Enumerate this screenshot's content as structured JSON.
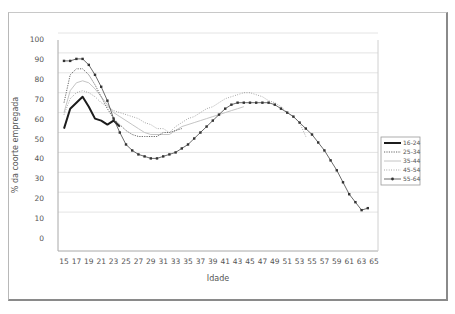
{
  "chart_data": {
    "type": "line",
    "title": "",
    "xlabel": "Idade",
    "ylabel": "% da coorte empregada",
    "ylim": [
      0,
      100
    ],
    "xlim": [
      15,
      65
    ],
    "grid": true,
    "legend_position": "right",
    "y_ticks": [
      "100",
      "90",
      "80",
      "70",
      "60",
      "50",
      "40",
      "30",
      "20",
      "10",
      "0"
    ],
    "x_ticks": [
      "15",
      "17",
      "19",
      "21",
      "23",
      "25",
      "27",
      "29",
      "31",
      "33",
      "35",
      "37",
      "39",
      "41",
      "43",
      "45",
      "47",
      "49",
      "51",
      "53",
      "55",
      "57",
      "59",
      "61",
      "63",
      "65"
    ],
    "series": [
      {
        "name": "16-24",
        "style": "thick-solid",
        "x": [
          15,
          16,
          17,
          18,
          19,
          20,
          21,
          22,
          23,
          24
        ],
        "values": [
          55,
          65,
          68,
          71,
          66,
          60,
          59,
          57,
          59,
          56
        ]
      },
      {
        "name": "25-34",
        "style": "dotted",
        "x": [
          15,
          16,
          17,
          18,
          19,
          20,
          21,
          22,
          23,
          24,
          25,
          26,
          27,
          28,
          29,
          30,
          31,
          32,
          33,
          34
        ],
        "values": [
          68,
          82,
          85,
          85,
          82,
          77,
          71,
          65,
          60,
          57,
          54,
          52,
          51,
          51,
          51,
          51,
          53,
          53,
          54,
          55
        ]
      },
      {
        "name": "35-44",
        "style": "thin-solid-light",
        "x": [
          15,
          16,
          17,
          18,
          19,
          20,
          21,
          22,
          23,
          24,
          25,
          26,
          27,
          28,
          29,
          30,
          31,
          32,
          33,
          34,
          35,
          36,
          37,
          38,
          39,
          40,
          41,
          42,
          43,
          44
        ],
        "values": [
          63,
          74,
          78,
          79,
          78,
          75,
          71,
          67,
          63,
          61,
          59,
          57,
          55,
          53,
          52,
          52,
          52,
          52,
          54,
          56,
          57,
          58,
          59,
          60,
          61,
          62,
          63,
          64,
          65,
          66
        ]
      },
      {
        "name": "45-54",
        "style": "fine-dotted",
        "x": [
          15,
          16,
          17,
          18,
          19,
          20,
          21,
          22,
          23,
          24,
          25,
          26,
          27,
          28,
          29,
          30,
          31,
          32,
          33,
          34,
          35,
          36,
          37,
          38,
          39,
          40,
          41,
          42,
          43,
          44,
          45,
          46,
          47,
          48,
          49,
          50,
          51,
          52,
          53,
          54
        ],
        "values": [
          62,
          70,
          73,
          74,
          73,
          71,
          68,
          66,
          64,
          63,
          62,
          61,
          60,
          58,
          57,
          55,
          55,
          53,
          56,
          58,
          60,
          61,
          63,
          65,
          66,
          68,
          70,
          71,
          72,
          73,
          73,
          72,
          71,
          69,
          68,
          66,
          63,
          61,
          58,
          51
        ]
      },
      {
        "name": "55-64",
        "style": "solid-with-markers",
        "x": [
          15,
          16,
          17,
          18,
          19,
          20,
          21,
          22,
          23,
          24,
          25,
          26,
          27,
          28,
          29,
          30,
          31,
          32,
          33,
          34,
          35,
          36,
          37,
          38,
          39,
          40,
          41,
          42,
          43,
          44,
          45,
          46,
          47,
          48,
          49,
          50,
          51,
          52,
          53,
          54,
          55,
          56,
          57,
          58,
          59,
          60,
          61,
          62,
          63,
          64
        ],
        "values": [
          89,
          89,
          90,
          90,
          87,
          82,
          76,
          69,
          60,
          53,
          47,
          44,
          42,
          41,
          40,
          40,
          41,
          42,
          43,
          45,
          47,
          50,
          53,
          56,
          59,
          62,
          65,
          67,
          68,
          68,
          68,
          68,
          68,
          68,
          67,
          65,
          63,
          61,
          58,
          55,
          52,
          48,
          44,
          39,
          34,
          28,
          22,
          18,
          14,
          15
        ]
      }
    ]
  },
  "legend": {
    "items": [
      {
        "label": "16-24"
      },
      {
        "label": "25-34"
      },
      {
        "label": "35-44"
      },
      {
        "label": "45-54"
      },
      {
        "label": "55-64"
      }
    ]
  },
  "axes": {
    "xlabel": "Idade",
    "ylabel": "% da coorte empregada"
  },
  "colors": {
    "line_dark": "#222222",
    "line_mid": "#555555",
    "line_light": "#9a9a9a",
    "grid": "#e4e4e4",
    "axis": "#9a9a9a"
  }
}
